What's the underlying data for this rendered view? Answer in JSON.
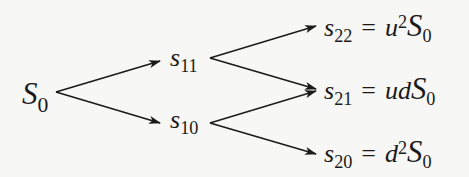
{
  "diagram": {
    "type": "binomial-tree",
    "steps": 2,
    "root": {
      "var": "S",
      "sub": "0"
    },
    "level1": [
      {
        "var": "s",
        "sub": "11"
      },
      {
        "var": "s",
        "sub": "10"
      }
    ],
    "level2": [
      {
        "var": "s",
        "sub": "22",
        "eq": "=",
        "rhs_pre": "u",
        "rhs_sup": "2",
        "rhs_var": "S",
        "rhs_sub": "0"
      },
      {
        "var": "s",
        "sub": "21",
        "eq": "=",
        "rhs_pre": "ud",
        "rhs_sup": "",
        "rhs_var": "S",
        "rhs_sub": "0"
      },
      {
        "var": "s",
        "sub": "20",
        "eq": "=",
        "rhs_pre": "d",
        "rhs_sup": "2",
        "rhs_var": "S",
        "rhs_sub": "0"
      }
    ],
    "edges": [
      [
        "S0",
        "s11"
      ],
      [
        "S0",
        "s10"
      ],
      [
        "s11",
        "s22"
      ],
      [
        "s11",
        "s21"
      ],
      [
        "s10",
        "s21"
      ],
      [
        "s10",
        "s20"
      ]
    ],
    "colors": {
      "stroke": "#1a1a1a",
      "background": "#f7f7f5"
    }
  }
}
